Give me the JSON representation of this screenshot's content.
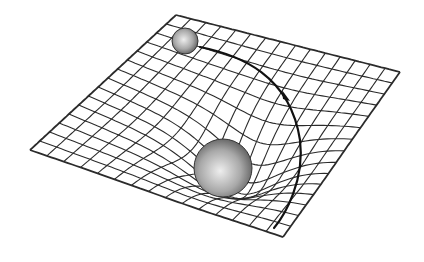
{
  "diagram": {
    "title": "",
    "colors": {
      "background": "#ffffff",
      "grid_line": "#2b2b2b",
      "sphere_light": "#e8e8e8",
      "sphere_mid": "#a8a8a8",
      "sphere_dark": "#5a5a5a",
      "trajectory": "#111111"
    },
    "grid": {
      "corners": {
        "top": [
          176,
          15
        ],
        "right": [
          400,
          72
        ],
        "bottom": [
          283,
          237
        ],
        "left": [
          30,
          150
        ]
      },
      "divisions_u": 15,
      "divisions_v": 15,
      "well_center_uv": [
        0.62,
        0.58
      ],
      "well_depth": 42,
      "well_width": 0.16
    },
    "large_mass": {
      "label": "",
      "cx": 223,
      "cy": 168,
      "r": 29
    },
    "small_body": {
      "label": "",
      "cx": 185,
      "cy": 41,
      "r": 13
    },
    "trajectory": {
      "path": "M 200 47 C 240 55, 290 75, 300 140 C 305 180, 285 215, 274 228",
      "arrow_at": [
        287,
        96
      ]
    }
  }
}
